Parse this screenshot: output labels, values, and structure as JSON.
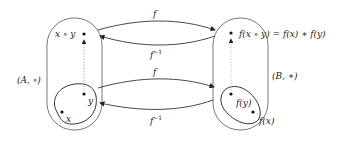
{
  "diagram": {
    "title": "",
    "left_set": {
      "label": "(A, ∘)",
      "elements": {
        "composite": "x ∘ y",
        "x": "x",
        "y": "y"
      }
    },
    "right_set": {
      "label": "(B, ∗)",
      "elements": {
        "composite": "f(x ∘ y) = f(x) ∗ f(y)",
        "fy": "f(y)",
        "fx": "f(x)"
      }
    },
    "arrows": {
      "top_forward": "f",
      "top_inverse": "f",
      "top_inverse_sup": "−1",
      "bottom_forward": "f",
      "bottom_inverse": "f",
      "bottom_inverse_sup": "−1"
    },
    "colors": {
      "stroke": "#333333",
      "dotted": "#999999",
      "text": "#222222"
    }
  }
}
